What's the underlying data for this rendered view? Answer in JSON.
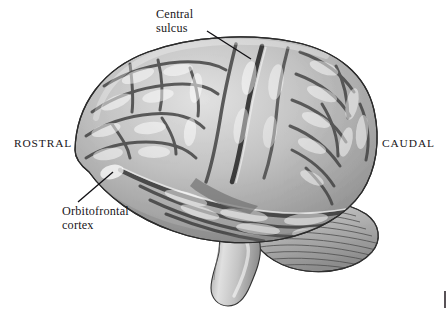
{
  "figure": {
    "background_color": "#ffffff",
    "width": 447,
    "height": 314
  },
  "labels": {
    "central_sulcus": "Central\nsulcus",
    "orbitofrontal_cortex": "Orbitofrontal\ncortex",
    "rostral": "ROSTRAL",
    "caudal": "CAUDAL"
  },
  "colors": {
    "text": "#19161a",
    "leader_line": "#111014",
    "cortex_mid": "#a9a9a9",
    "cortex_light": "#d8d8d8",
    "cortex_highlight": "#f2f2f2",
    "sulcus_dark": "#4a4a4a",
    "outline": "#2c2c2c",
    "cerebellum": "#b4b4b4",
    "brainstem": "#bdbdbd"
  },
  "annotations": {
    "central_sulcus_leader": {
      "from_x": 207,
      "from_y": 31,
      "to_x": 250,
      "to_y": 58
    },
    "orbitofrontal_leader": {
      "from_x": 78,
      "from_y": 202,
      "to_x": 112,
      "to_y": 173
    }
  },
  "anatomy": {
    "regions": [
      "cerebral cortex",
      "frontal lobe",
      "parietal lobe",
      "temporal lobe",
      "occipital lobe",
      "cerebellum",
      "brainstem"
    ]
  }
}
